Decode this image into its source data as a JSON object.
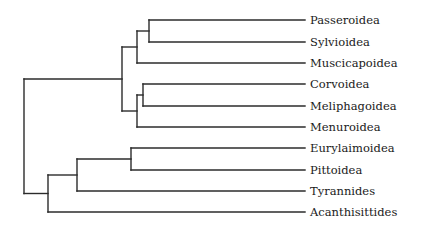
{
  "diagram": {
    "type": "phylogenetic-tree",
    "orientation": "left-to-right",
    "line_color": "#2b2b2b",
    "leaf_end_x": 305,
    "label_x": 310,
    "leaves": [
      {
        "id": "passeroidea",
        "label": "Passeroidea",
        "y": 20
      },
      {
        "id": "sylvioidea",
        "label": "Sylvioidea",
        "y": 42
      },
      {
        "id": "muscicapoidea",
        "label": "Muscicapoidea",
        "y": 63
      },
      {
        "id": "corvoidea",
        "label": "Corvoidea",
        "y": 84
      },
      {
        "id": "meliphagoidea",
        "label": "Meliphagoidea",
        "y": 106
      },
      {
        "id": "menuroidea",
        "label": "Menuroidea",
        "y": 127
      },
      {
        "id": "eurylaimoidea",
        "label": "Eurylaimoidea",
        "y": 148
      },
      {
        "id": "pittoidea",
        "label": "Pittoidea",
        "y": 170
      },
      {
        "id": "tyrannides",
        "label": "Tyrannides",
        "y": 191
      },
      {
        "id": "acanthisittides",
        "label": "Acanthisittides",
        "y": 212
      }
    ],
    "nodes": [
      {
        "id": "n_pass_sylv",
        "x": 149,
        "children": [
          "passeroidea",
          "sylvioidea"
        ]
      },
      {
        "id": "n_passerida",
        "x": 137,
        "children": [
          "n_pass_sylv",
          "muscicapoidea"
        ]
      },
      {
        "id": "n_corv_meli",
        "x": 143,
        "children": [
          "corvoidea",
          "meliphagoidea"
        ]
      },
      {
        "id": "n_corvida",
        "x": 137,
        "children": [
          "n_corv_meli",
          "menuroidea"
        ]
      },
      {
        "id": "n_oscines",
        "x": 122,
        "children": [
          "n_passerida",
          "n_corvida"
        ]
      },
      {
        "id": "n_eury_pitt",
        "x": 131,
        "children": [
          "eurylaimoidea",
          "pittoidea"
        ]
      },
      {
        "id": "n_suboscines",
        "x": 77,
        "children": [
          "n_eury_pitt",
          "tyrannides"
        ]
      },
      {
        "id": "n_basal",
        "x": 48,
        "children": [
          "n_suboscines",
          "acanthisittides"
        ]
      },
      {
        "id": "root",
        "x": 24,
        "children": [
          "n_oscines",
          "n_basal"
        ]
      }
    ]
  }
}
